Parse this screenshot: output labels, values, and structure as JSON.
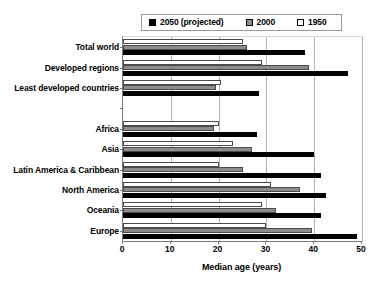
{
  "chart_data": {
    "type": "bar",
    "orientation": "horizontal",
    "title": "",
    "subtitle": "",
    "xlabel": "Median age (years)",
    "ylabel": "",
    "xlim": [
      0,
      50
    ],
    "xticks": [
      0,
      10,
      20,
      30,
      40,
      50
    ],
    "xtick_labels": [
      "0",
      "10",
      "20",
      "30",
      "40",
      "50"
    ],
    "grid": true,
    "grid_axis": "x",
    "legend_position": "top",
    "categories": [
      "Total world",
      "Developed regions",
      "Least developed countries",
      "",
      "Africa",
      "Asia",
      "Latin America & Caribbean",
      "North America",
      "Oceania",
      "Europe"
    ],
    "series": [
      {
        "name": "2050 (projected)",
        "color": "#000000",
        "values": [
          38,
          47,
          28.5,
          null,
          28,
          40,
          41.5,
          42.5,
          41.5,
          49
        ]
      },
      {
        "name": "2000",
        "color": "#8c8c8c",
        "values": [
          26,
          39,
          19.5,
          null,
          19,
          27,
          25,
          37,
          32,
          39.5
        ]
      },
      {
        "name": "1950",
        "color": "#ffffff",
        "values": [
          25,
          29,
          20.5,
          null,
          20,
          23,
          20,
          31,
          29,
          30
        ]
      }
    ]
  },
  "legend": {
    "entries": [
      {
        "label": "2050 (projected)",
        "swatch": "#000000"
      },
      {
        "label": "2000",
        "swatch": "#8c8c8c"
      },
      {
        "label": "1950",
        "swatch": "#ffffff"
      }
    ]
  },
  "axis": {
    "x_title": "Median age (years)",
    "x_tick_labels": [
      "0",
      "10",
      "20",
      "30",
      "40",
      "50"
    ]
  },
  "category_labels": [
    "Total world",
    "Developed regions",
    "Least developed countries",
    "",
    "Africa",
    "Asia",
    "Latin America & Caribbean",
    "North America",
    "Oceania",
    "Europe"
  ]
}
